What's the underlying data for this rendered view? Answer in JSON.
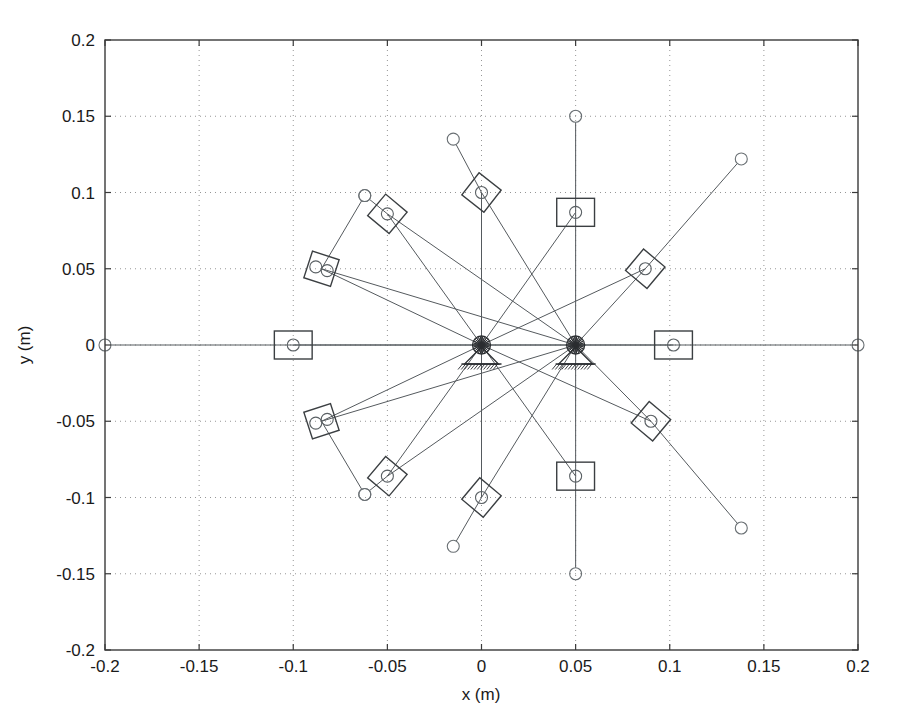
{
  "figure": {
    "kind": "mechanism-workspace-plot",
    "background_color": "#ffffff",
    "line_color": "#555a5e",
    "marker_color": "#3b3f42",
    "grid_color": "#8a8a8a",
    "axis_color": "#3a3a3a"
  },
  "axes": {
    "x_title": "x (m)",
    "y_title": "y (m)",
    "x_ticks": [
      "-0.2",
      "-0.15",
      "-0.1",
      "-0.05",
      "0",
      "0.05",
      "0.1",
      "0.15",
      "0.2"
    ],
    "y_ticks": [
      "0.2",
      "0.15",
      "0.1",
      "0.05",
      "0",
      "-0.05",
      "-0.1",
      "-0.15",
      "-0.2"
    ]
  },
  "chart_data": {
    "type": "scatter",
    "title": "",
    "xlabel": "x (m)",
    "ylabel": "y (m)",
    "xlim": [
      -0.2,
      0.2
    ],
    "ylim": [
      -0.2,
      0.2
    ],
    "xticks": [
      -0.2,
      -0.15,
      -0.1,
      -0.05,
      0,
      0.05,
      0.1,
      0.15,
      0.2
    ],
    "yticks": [
      -0.2,
      -0.15,
      -0.1,
      -0.05,
      0,
      0.05,
      0.1,
      0.15,
      0.2
    ],
    "grid": true,
    "legend": "none",
    "aspect": "equal",
    "pivots": [
      {
        "name": "ground-pivot-left",
        "x": 0.0,
        "y": 0.0
      },
      {
        "name": "ground-pivot-right",
        "x": 0.05,
        "y": 0.0
      }
    ],
    "poses": [
      {
        "id": 1,
        "angle_deg": 0,
        "platform_x": -0.1,
        "platform_y": 0.0,
        "platform_rot_deg": 0,
        "joint_count": 1,
        "tip_x": -0.2,
        "tip_y": 0.0,
        "square_style": "axis-aligned"
      },
      {
        "id": 2,
        "angle_deg": 30,
        "platform_x": -0.085,
        "platform_y": 0.05,
        "platform_rot_deg": 18,
        "joint_count": 2,
        "tip_x": -0.062,
        "tip_y": 0.098,
        "square_style": "rotated"
      },
      {
        "id": 3,
        "angle_deg": 60,
        "platform_x": -0.05,
        "platform_y": 0.086,
        "platform_rot_deg": 40,
        "joint_count": 1,
        "tip_x": -0.062,
        "tip_y": 0.098,
        "square_style": "rotated"
      },
      {
        "id": 4,
        "angle_deg": 90,
        "platform_x": 0.0,
        "platform_y": 0.1,
        "platform_rot_deg": 38,
        "joint_count": 1,
        "tip_x": -0.015,
        "tip_y": 0.135,
        "square_style": "rotated"
      },
      {
        "id": 5,
        "angle_deg": 120,
        "platform_x": 0.05,
        "platform_y": 0.087,
        "platform_rot_deg": 0,
        "joint_count": 1,
        "tip_x": 0.05,
        "tip_y": 0.15,
        "square_style": "axis-aligned"
      },
      {
        "id": 6,
        "angle_deg": 150,
        "platform_x": 0.087,
        "platform_y": 0.05,
        "platform_rot_deg": 40,
        "joint_count": 1,
        "tip_x": 0.138,
        "tip_y": 0.122,
        "square_style": "rotated"
      },
      {
        "id": 7,
        "angle_deg": 180,
        "platform_x": 0.102,
        "platform_y": 0.0,
        "platform_rot_deg": 0,
        "joint_count": 1,
        "tip_x": 0.2,
        "tip_y": 0.0,
        "square_style": "axis-aligned"
      },
      {
        "id": 8,
        "angle_deg": 210,
        "platform_x": 0.09,
        "platform_y": -0.05,
        "platform_rot_deg": 40,
        "joint_count": 1,
        "tip_x": 0.138,
        "tip_y": -0.12,
        "square_style": "rotated"
      },
      {
        "id": 9,
        "angle_deg": 240,
        "platform_x": 0.05,
        "platform_y": -0.086,
        "platform_rot_deg": 0,
        "joint_count": 1,
        "tip_x": 0.05,
        "tip_y": -0.15,
        "square_style": "axis-aligned"
      },
      {
        "id": 10,
        "angle_deg": 270,
        "platform_x": 0.0,
        "platform_y": -0.1,
        "platform_rot_deg": 40,
        "joint_count": 1,
        "tip_x": -0.015,
        "tip_y": -0.132,
        "square_style": "rotated"
      },
      {
        "id": 11,
        "angle_deg": 300,
        "platform_x": -0.05,
        "platform_y": -0.086,
        "platform_rot_deg": 40,
        "joint_count": 1,
        "tip_x": -0.062,
        "tip_y": -0.098,
        "square_style": "rotated"
      },
      {
        "id": 12,
        "angle_deg": 330,
        "platform_x": -0.085,
        "platform_y": -0.05,
        "platform_rot_deg": -18,
        "joint_count": 2,
        "tip_x": -0.062,
        "tip_y": -0.098,
        "square_style": "rotated"
      }
    ]
  }
}
